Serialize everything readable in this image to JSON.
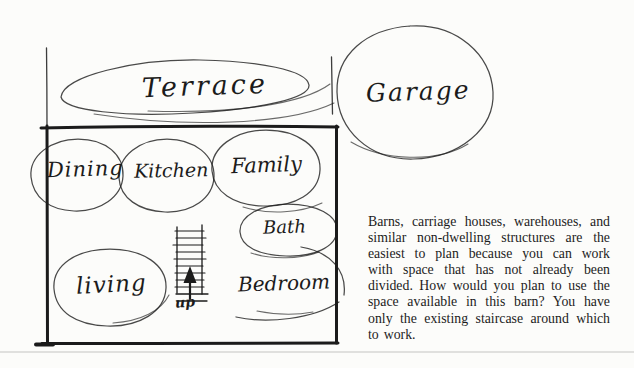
{
  "page": {
    "background": "#fcfcfa",
    "ink_color": "#1b1b1b",
    "text_color": "#1d1d1d",
    "divider_color": "#e0e0de"
  },
  "floor_plan": {
    "rooms": {
      "terrace": "Terrace",
      "garage": "Garage",
      "dining": "Dining",
      "kitchen": "Kitchen",
      "family": "Family",
      "bath": "Bath",
      "living": "living",
      "bedroom": "Bedroom"
    },
    "staircase_label": "up"
  },
  "caption": {
    "text": "Barns, carriage houses, warehouses, and similar non-dwelling structures are the easiest to plan because you can work with space that has not already been divided. How would you plan to use the space available in this barn? You have only the existing staircase around which to work."
  }
}
